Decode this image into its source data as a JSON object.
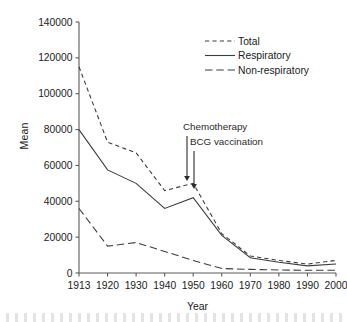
{
  "chart_data": {
    "type": "line",
    "title": "",
    "xlabel": "Year",
    "ylabel": "Mean",
    "x": [
      1913,
      1920,
      1930,
      1940,
      1950,
      1960,
      1970,
      1980,
      1990,
      2000
    ],
    "xtick_labels": [
      "1913",
      "1920",
      "1930",
      "1940",
      "1950",
      "1960",
      "1970",
      "1980",
      "1990",
      "2000"
    ],
    "ytick_labels": [
      "0",
      "20000",
      "40000",
      "60000",
      "80000",
      "100000",
      "120000",
      "140000"
    ],
    "yticks": [
      0,
      20000,
      40000,
      60000,
      80000,
      100000,
      120000,
      140000
    ],
    "ylim": [
      0,
      140000
    ],
    "xlim": [
      1913,
      2000
    ],
    "grid": false,
    "legend_position": "upper right",
    "series": [
      {
        "name": "Total",
        "style": "dashed",
        "values": [
          115000,
          73000,
          67000,
          46000,
          50000,
          22000,
          9500,
          7000,
          5000,
          7000
        ]
      },
      {
        "name": "Respiratory",
        "style": "solid",
        "values": [
          80000,
          57500,
          50000,
          36000,
          42000,
          21000,
          8500,
          6000,
          4000,
          5000
        ]
      },
      {
        "name": "Non-respiratory",
        "style": "long-dashed",
        "values": [
          36000,
          15000,
          17000,
          12000,
          7000,
          2500,
          2000,
          1700,
          1500,
          1500
        ]
      }
    ],
    "annotations": [
      {
        "label": "Chemotherapy",
        "points_to_year": 1950,
        "points_to_value": 50000
      },
      {
        "label": "BCG vaccination",
        "points_to_year": 1952,
        "points_to_value": 46000
      }
    ]
  },
  "axis": {
    "ylabel": "Mean",
    "xlabel": "Year"
  },
  "legend": {
    "items": [
      {
        "label": "Total"
      },
      {
        "label": "Respiratory"
      },
      {
        "label": "Non-respiratory"
      }
    ]
  }
}
